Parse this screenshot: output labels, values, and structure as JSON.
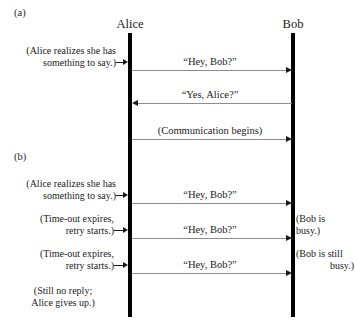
{
  "figure": {
    "panels": [
      {
        "id": "a",
        "label": "(a)"
      },
      {
        "id": "b",
        "label": "(b)"
      }
    ],
    "actors": [
      {
        "id": "alice",
        "name": "Alice"
      },
      {
        "id": "bob",
        "name": "Bob"
      }
    ],
    "messages": [
      {
        "id": "m1",
        "label": "“Hey, Bob?”",
        "direction": "right",
        "panel": "a"
      },
      {
        "id": "m2",
        "label": "“Yes, Alice?”",
        "direction": "left",
        "panel": "a"
      },
      {
        "id": "m3",
        "label": "(Communication begins)",
        "direction": "right",
        "panel": "a"
      },
      {
        "id": "m4",
        "label": "“Hey, Bob?”",
        "direction": "right",
        "panel": "b"
      },
      {
        "id": "m5",
        "label": "“Hey, Bob?”",
        "direction": "right",
        "panel": "b"
      },
      {
        "id": "m6",
        "label": "“Hey, Bob?”",
        "direction": "right",
        "panel": "b"
      }
    ],
    "left_notes": [
      {
        "id": "n1",
        "line1": "(Alice realizes she has",
        "line2": "something to say.)",
        "panel": "a"
      },
      {
        "id": "n2",
        "line1": "(Alice realizes she has",
        "line2": "something to say.)",
        "panel": "b"
      },
      {
        "id": "n3",
        "line1": "(Time-out expires,",
        "line2": "retry starts.)",
        "panel": "b"
      },
      {
        "id": "n4",
        "line1": "(Time-out expires,",
        "line2": "retry starts.)",
        "panel": "b"
      },
      {
        "id": "n5",
        "line1": "(Still no reply;",
        "line2": "Alice gives up.)",
        "panel": "b"
      }
    ],
    "right_notes": [
      {
        "id": "r1",
        "line1": "(Bob is",
        "line2": "busy.)",
        "panel": "b"
      },
      {
        "id": "r2",
        "line1": "(Bob is still",
        "line2": "busy.)",
        "panel": "b"
      }
    ],
    "colors": {
      "lifeline": "#000000",
      "arrow_line": "#8c8c8c",
      "arrow_head": "#1a1a1a",
      "text": "#1a1a1a",
      "background": "#ffffff"
    }
  }
}
